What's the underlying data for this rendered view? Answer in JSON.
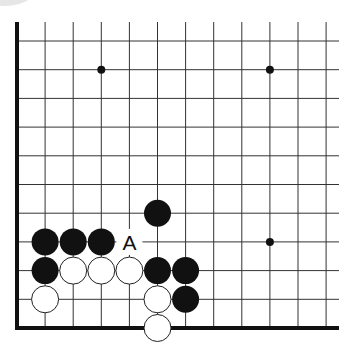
{
  "board": {
    "type": "go-problem-diagram",
    "edges": [
      "left",
      "bottom"
    ],
    "grid": {
      "origin_x": 17,
      "origin_y": 41,
      "spacing_x": 28.1,
      "spacing_y": 28.7,
      "cols": 12,
      "rows": 11,
      "right_extent_x": 339,
      "top_extent_y": 22
    },
    "colors": {
      "line": "#333333",
      "edge": "#111111",
      "black_stone": "#111111",
      "white_stone": "#ffffff",
      "white_stone_border": "#222222"
    },
    "star_points": [
      {
        "col": 3,
        "row": 1
      },
      {
        "col": 9,
        "row": 1
      },
      {
        "col": 9,
        "row": 7
      }
    ],
    "black_stones": [
      {
        "col": 1,
        "row": 7
      },
      {
        "col": 2,
        "row": 7
      },
      {
        "col": 3,
        "row": 7
      },
      {
        "col": 1,
        "row": 8
      },
      {
        "col": 5,
        "row": 6
      },
      {
        "col": 5,
        "row": 8
      },
      {
        "col": 6,
        "row": 8
      },
      {
        "col": 6,
        "row": 9
      }
    ],
    "white_stones": [
      {
        "col": 2,
        "row": 8
      },
      {
        "col": 3,
        "row": 8
      },
      {
        "col": 4,
        "row": 8
      },
      {
        "col": 1,
        "row": 9
      },
      {
        "col": 5,
        "row": 9
      },
      {
        "col": 5,
        "row": 10
      }
    ],
    "labels": [
      {
        "text": "A",
        "col": 4,
        "row": 7
      }
    ]
  }
}
